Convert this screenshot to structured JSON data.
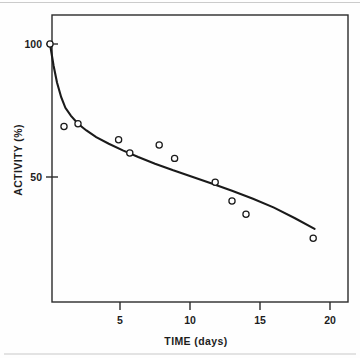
{
  "chart_data": {
    "type": "scatter",
    "title": "",
    "subtitle": "",
    "xlabel": "TIME (days)",
    "ylabel": "ACTIVITY (%)",
    "xlim": [
      0,
      21.3
    ],
    "ylim": [
      0,
      108
    ],
    "xticks": [
      5,
      10,
      15,
      20
    ],
    "xticklabels": [
      "5",
      "10",
      "15",
      "20"
    ],
    "yticks": [
      50,
      100
    ],
    "yticklabels": [
      "50",
      "100"
    ],
    "grid": false,
    "legend": null,
    "legend_position": "none",
    "marker_style": "open-circle",
    "annotations": [],
    "series": [
      {
        "name": "measured activity",
        "type": "scatter",
        "x": [
          0,
          1.0,
          2.0,
          4.9,
          5.7,
          7.8,
          8.9,
          11.8,
          13.0,
          14.0,
          18.8
        ],
        "y": [
          100,
          69,
          70,
          64,
          59,
          62,
          57,
          48,
          41,
          36,
          27
        ]
      },
      {
        "name": "fitted decay curve",
        "type": "line",
        "x": [
          0,
          0.25,
          0.5,
          0.8,
          1.1,
          1.5,
          2.0,
          2.6,
          3.3,
          4.2,
          5.2,
          6.3,
          7.5,
          8.8,
          10.2,
          11.6,
          13.0,
          14.5,
          16.0,
          17.5,
          18.9
        ],
        "y": [
          100,
          92,
          85.5,
          80,
          76,
          73,
          70,
          67.5,
          65,
          62.5,
          60,
          57.5,
          55,
          52.5,
          50,
          47.5,
          44.8,
          41.8,
          38.5,
          34.5,
          30.5
        ]
      }
    ]
  },
  "axes": {
    "x_axis_name": "time-axis",
    "y_axis_name": "activity-axis"
  },
  "colors": {
    "curve": "#1a1a1a",
    "marker_stroke": "#1a1a1a",
    "marker_fill": "#ffffff",
    "frame": "#2b2b2b",
    "text": "#1d1d1d",
    "background": "#fefefe"
  }
}
